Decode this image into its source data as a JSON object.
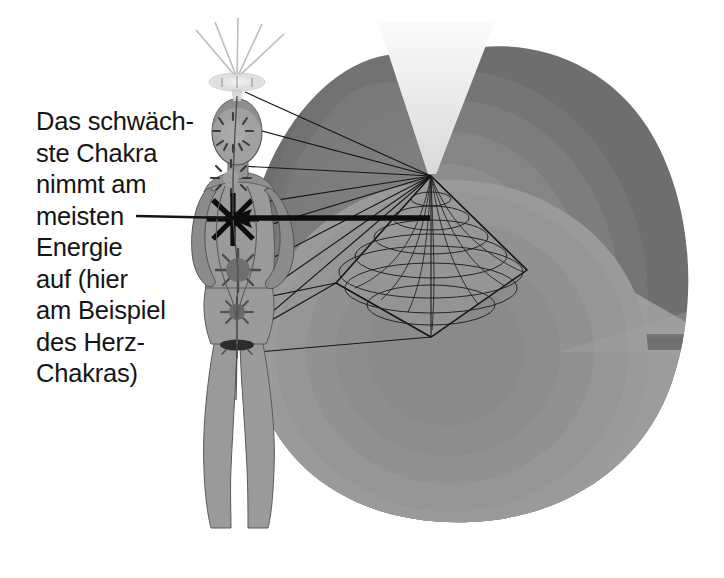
{
  "figure": {
    "caption_text": "Das schwäch-\nste Chakra\nnimmt am\nmeisten\nEnergie\nauf (hier\nam Beispiel\ndes Herz-\nChakras)",
    "caption_lines": [
      "Das schwäch-",
      "ste Chakra",
      "nimmt am",
      "meisten",
      "Energie",
      "auf (hier",
      "am Beispiel",
      "des Herz-",
      "Chakras)"
    ],
    "language": "de"
  },
  "colors": {
    "background": "#ffffff",
    "text": "#151515",
    "line": "#1a1a1a",
    "aura_outer": "#6e6e6e",
    "aura_mid": "#7c7c7c",
    "aura_inner": "#8a8a8a",
    "aura_core": "#949494",
    "aura_lower": "#9b9b9b",
    "aura_lower_inner": "#8f8f8f",
    "dark_band": "#525252",
    "funnel_light": "#ededed",
    "body_fill": "#9a9a9a",
    "body_shadow": "#7d7d7d",
    "body_outline": "#4a4a4a",
    "crown_glow": "#e3e3e3",
    "chakra_weak": "#111111",
    "chakra_normal": "#5d5d5d"
  },
  "elements": {
    "body_label": "weibliche Figur",
    "aura_label": "Aura / Energiefeld",
    "vortex_label": "Energie-Wirbel",
    "funnel_label": "Lichttrichter",
    "crown_label": "Kronen-Chakra Strahlen",
    "pointer_label": "Pfeil zum Herz-Chakra",
    "leader_label": "Verbindungslinie"
  },
  "chakras": [
    {
      "name": "kronen-chakra",
      "label": "Kronen-Chakra",
      "cx": 237,
      "cy": 83,
      "r": 15,
      "strength": "normal"
    },
    {
      "name": "stirn-chakra",
      "label": "Stirn-Chakra",
      "cx": 232,
      "cy": 133,
      "r": 19,
      "strength": "normal"
    },
    {
      "name": "hals-chakra",
      "label": "Hals-Chakra",
      "cx": 231,
      "cy": 177,
      "r": 17,
      "strength": "normal"
    },
    {
      "name": "herz-chakra",
      "label": "Herz-Chakra",
      "cx": 233,
      "cy": 219,
      "r": 24,
      "strength": "weak"
    },
    {
      "name": "solar-chakra",
      "label": "Solarplexus-Chakra",
      "cx": 238,
      "cy": 270,
      "r": 20,
      "strength": "normal"
    },
    {
      "name": "sakral-chakra",
      "label": "Sakral-Chakra",
      "cx": 237,
      "cy": 312,
      "r": 14,
      "strength": "normal"
    },
    {
      "name": "wurzel-chakra",
      "label": "Wurzel-Chakra",
      "cx": 237,
      "cy": 345,
      "r": 12,
      "strength": "normal"
    }
  ],
  "aura_rings": [
    {
      "label": "ring-1-aussen",
      "fill": "#6e6e6e"
    },
    {
      "label": "ring-2",
      "fill": "#767676"
    },
    {
      "label": "ring-3",
      "fill": "#7e7e7e"
    },
    {
      "label": "ring-4",
      "fill": "#868686"
    },
    {
      "label": "ring-5-innen",
      "fill": "#909090"
    }
  ],
  "vortex": {
    "label": "Doppelkegel / Oktaeder Wirbel",
    "apex_x": 431,
    "apex_y": 176,
    "bottom_x": 431,
    "bottom_y": 337,
    "left_x": 336,
    "left_y": 283,
    "right_x": 527,
    "right_y": 270,
    "ring_count": 7,
    "meridian_count": 9
  }
}
